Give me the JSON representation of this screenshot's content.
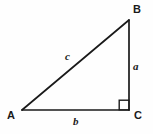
{
  "figure": {
    "background_color": "#fefefe",
    "stroke_color": "#1a1a1a",
    "stroke_width": 1.6,
    "vertices": {
      "A": {
        "label": "A",
        "x": 22,
        "y": 110
      },
      "B": {
        "label": "B",
        "x": 129,
        "y": 20
      },
      "C": {
        "label": "C",
        "x": 129,
        "y": 110
      }
    },
    "sides": {
      "a": {
        "label": "a",
        "from": "B",
        "to": "C",
        "description": "vertical leg"
      },
      "b": {
        "label": "b",
        "from": "A",
        "to": "C",
        "description": "horizontal leg"
      },
      "c": {
        "label": "c",
        "from": "A",
        "to": "B",
        "description": "hypotenuse"
      }
    },
    "right_angle": {
      "at": "C",
      "marker": "right-angle-square",
      "size": 10
    }
  }
}
